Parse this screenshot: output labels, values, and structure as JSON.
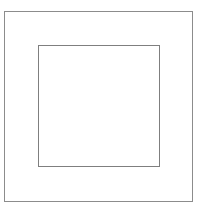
{
  "figure": {
    "type": "line-drawing",
    "canvas": {
      "width": 199,
      "height": 212,
      "background_color": "#ffffff"
    },
    "shapes": [
      {
        "name": "outer-square",
        "kind": "rectangle",
        "x": 4,
        "y": 11,
        "width": 189,
        "height": 191,
        "stroke_color": "#8c8c8c",
        "stroke_width": 1,
        "fill_color": "#ffffff",
        "label": ""
      },
      {
        "name": "inner-square",
        "kind": "rectangle",
        "x": 38,
        "y": 45,
        "width": 122,
        "height": 122,
        "stroke_color": "#7f7f7f",
        "stroke_width": 1,
        "fill_color": "#ffffff",
        "label": ""
      }
    ],
    "annotations": [],
    "text_content": []
  }
}
